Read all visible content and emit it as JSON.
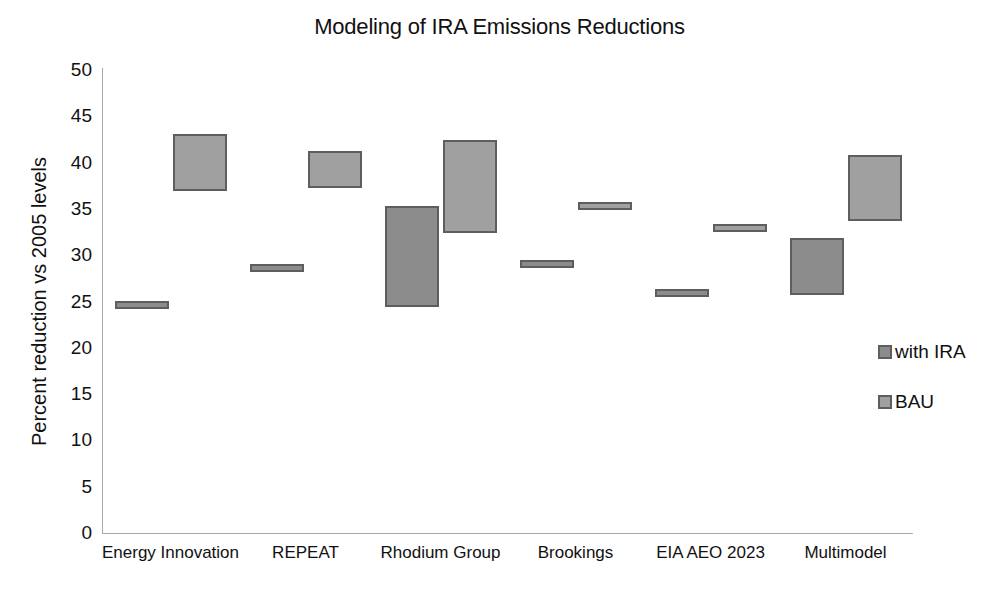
{
  "chart_data": {
    "type": "bar",
    "subtype": "floating-range-bar",
    "title": "Modeling of IRA Emissions Reductions",
    "xlabel": "",
    "ylabel": "Percent reduction vs 2005 levels",
    "ylim": [
      0,
      50
    ],
    "ytick_step": 5,
    "yticks": [
      50,
      45,
      40,
      35,
      30,
      25,
      20,
      15,
      10,
      5,
      0
    ],
    "grid": false,
    "legend_position": "right",
    "categories": [
      "Energy Innovation",
      "REPEAT",
      "Rhodium Group",
      "Brookings",
      "EIA AEO 2023",
      "Multimodel"
    ],
    "series": [
      {
        "name": "with IRA",
        "color": "#8c8c8c",
        "ranges": [
          {
            "category": "Energy Innovation",
            "low": 24.5,
            "high": 25.1
          },
          {
            "category": "REPEAT",
            "low": 28.6,
            "high": 29.1
          },
          {
            "category": "Rhodium Group",
            "low": 24.4,
            "high": 35.3
          },
          {
            "category": "Brookings",
            "low": 28.9,
            "high": 29.5
          },
          {
            "category": "EIA AEO 2023",
            "low": 25.9,
            "high": 26.4
          },
          {
            "category": "Multimodel",
            "low": 25.7,
            "high": 31.9
          }
        ]
      },
      {
        "name": "BAU",
        "color": "#a0a0a0",
        "ranges": [
          {
            "category": "Energy Innovation",
            "low": 36.9,
            "high": 43.1
          },
          {
            "category": "REPEAT",
            "low": 37.3,
            "high": 41.3
          },
          {
            "category": "Rhodium Group",
            "low": 32.4,
            "high": 42.4
          },
          {
            "category": "Brookings",
            "low": 35.0,
            "high": 35.7
          },
          {
            "category": "EIA AEO 2023",
            "low": 32.8,
            "high": 33.4
          },
          {
            "category": "Multimodel",
            "low": 33.7,
            "high": 40.8
          }
        ]
      }
    ]
  },
  "axis": {
    "y_title": "Percent reduction vs 2005 levels",
    "y_tick_labels": [
      "50",
      "45",
      "40",
      "35",
      "30",
      "25",
      "20",
      "15",
      "10",
      "5",
      "0"
    ]
  },
  "legend": {
    "entries": [
      {
        "label": "with IRA"
      },
      {
        "label": "BAU"
      }
    ]
  }
}
